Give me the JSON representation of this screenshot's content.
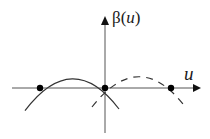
{
  "diagram": {
    "y_axis": {
      "label_prefix": "β(",
      "label_var": "u",
      "label_suffix": ")",
      "x": 105,
      "top": 16,
      "bottom": 133
    },
    "x_axis": {
      "label": "u",
      "y": 88,
      "left": 12,
      "right": 201
    },
    "solid_curve": {
      "description": "parabola opening downward",
      "roots": [
        40,
        105
      ],
      "peak": [
        72.5,
        68
      ],
      "x_range": [
        25,
        119
      ]
    },
    "dashed_curve": {
      "description": "dashed parabola opening downward",
      "roots": [
        105,
        171
      ],
      "peak": [
        138,
        68
      ],
      "x_range": [
        92,
        182
      ]
    },
    "points": [
      {
        "name": "left-root",
        "x": 40,
        "y": 88
      },
      {
        "name": "origin",
        "x": 105,
        "y": 88
      },
      {
        "name": "right-root",
        "x": 171,
        "y": 88
      }
    ],
    "colors": {
      "stroke": "#333333",
      "axis": "#555555",
      "point": "#000000"
    }
  }
}
